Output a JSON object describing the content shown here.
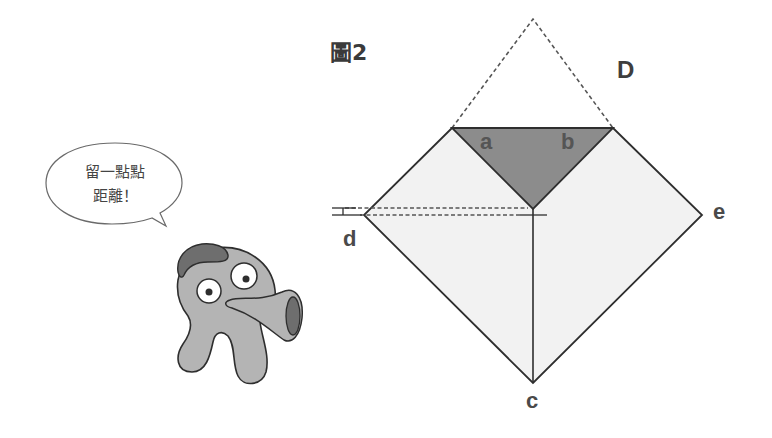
{
  "figure": {
    "title": "圖2"
  },
  "speech_bubble": {
    "line1": "留一點點",
    "line2": "距離！"
  },
  "labels": {
    "D": "D",
    "a": "a",
    "b": "b",
    "c": "c",
    "d": "d",
    "e": "e"
  },
  "colors": {
    "square_fill": "#f2f2f2",
    "triangle_fill": "#8c8c8c",
    "outline": "#2e2e2e",
    "dashed": "#555555",
    "character_body": "#b4b4b4",
    "character_dark": "#6e6e6e"
  },
  "geometry": {
    "apex_dashed": [
      533,
      19
    ],
    "top_left": [
      452,
      128
    ],
    "top_right": [
      613,
      128
    ],
    "vertex_d": [
      364,
      215
    ],
    "vertex_e": [
      702,
      215
    ],
    "vertex_c": [
      533,
      383
    ],
    "triangle_bottom": [
      533,
      209
    ]
  }
}
